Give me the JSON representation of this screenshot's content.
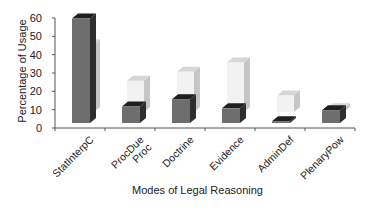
{
  "chart_data": {
    "type": "bar",
    "subtype": "3d-clustered-bar",
    "title": "",
    "xlabel": "Modes of Legal Reasoning",
    "ylabel": "Percentage of Usage",
    "ylim": [
      0,
      60
    ],
    "yticks": [
      0,
      10,
      20,
      30,
      40,
      50,
      60
    ],
    "grid": false,
    "legend": "none",
    "categories": [
      "StatInterpC",
      "ProcDue Proc",
      "Doctrine",
      "Evidence",
      "AdminDef",
      "PlenaryPow"
    ],
    "series": [
      {
        "name": "Series 1 (dark, front)",
        "color": "#6e6e6e",
        "values": [
          57,
          9,
          13,
          8,
          1,
          7
        ]
      },
      {
        "name": "Series 2 (light, back)",
        "color": "#eeeeee",
        "values": [
          37,
          17,
          22,
          27,
          9,
          2
        ]
      }
    ]
  },
  "labels": {
    "xlabel": "Modes of Legal Reasoning",
    "ylabel": "Percentage of Usage",
    "yticks": [
      "0",
      "10",
      "20",
      "30",
      "40",
      "50",
      "60"
    ],
    "categories": [
      "StatInterpC",
      "ProcDue\nProc",
      "Doctrine",
      "Evidence",
      "AdminDef",
      "PlenaryPow"
    ]
  },
  "colors": {
    "dark_front": "#6e6e6e",
    "dark_side": "#2e2e2e",
    "dark_top": "#1f1f1f",
    "light_front": "#f2f2f2",
    "light_side": "#c6c6c6",
    "light_top": "#d6d6d6",
    "axis": "#555555"
  }
}
